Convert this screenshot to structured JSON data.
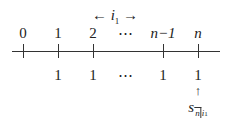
{
  "diagram": {
    "rate_label": {
      "left_arrow": "←",
      "symbol": "i",
      "subscript": "1",
      "right_arrow": "→"
    },
    "time_labels": [
      "0",
      "1",
      "2",
      "⋯",
      "n−1",
      "n"
    ],
    "payments": [
      "1",
      "1",
      "⋯",
      "1",
      "1"
    ],
    "pointer_arrow": "↑",
    "accumulated_value": {
      "symbol": "s",
      "subscript_term": "n",
      "subscript_rate": "i",
      "subscript_rate_index": "1"
    }
  }
}
